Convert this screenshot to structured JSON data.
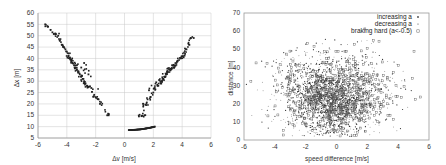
{
  "chart_data": [
    {
      "type": "scatter",
      "title": "",
      "xlabel": "Δv [m/s]",
      "ylabel": "Δx [m]",
      "xlim": [
        -6,
        6
      ],
      "ylim": [
        5,
        60
      ],
      "xticks": [
        -6,
        -4,
        -2,
        0,
        2,
        4,
        6
      ],
      "yticks": [
        5,
        10,
        15,
        20,
        25,
        30,
        35,
        40,
        45,
        50,
        55,
        60
      ],
      "grid": true,
      "legend": null,
      "series": [
        {
          "name": "left branch (closing in)",
          "description": "approximately linear band from (-5.5, 55) down to (-1.1, 15)",
          "points": [
            [
              -5.5,
              55
            ],
            [
              -5.3,
              54
            ],
            [
              -5.0,
              51.5
            ],
            [
              -4.8,
              51
            ],
            [
              -4.6,
              50
            ],
            [
              -4.5,
              48
            ],
            [
              -4.3,
              46
            ],
            [
              -4.2,
              45
            ],
            [
              -4.0,
              43
            ],
            [
              -3.9,
              41
            ],
            [
              -3.8,
              40
            ],
            [
              -3.7,
              39
            ],
            [
              -3.6,
              38
            ],
            [
              -3.5,
              37
            ],
            [
              -3.4,
              36
            ],
            [
              -3.3,
              35
            ],
            [
              -3.2,
              34
            ],
            [
              -3.1,
              33
            ],
            [
              -3.0,
              32
            ],
            [
              -2.9,
              31
            ],
            [
              -2.8,
              30
            ],
            [
              -2.7,
              29
            ],
            [
              -2.6,
              28
            ],
            [
              -2.5,
              27.5
            ],
            [
              -2.3,
              27
            ],
            [
              -2.1,
              24
            ],
            [
              -2.0,
              23
            ],
            [
              -1.8,
              22
            ],
            [
              -1.7,
              20
            ],
            [
              -1.2,
              15
            ],
            [
              -1.1,
              15
            ],
            [
              -2.8,
              38
            ],
            [
              -2.5,
              33
            ],
            [
              -3.0,
              36
            ],
            [
              -4.1,
              44
            ],
            [
              -3.3,
              37
            ]
          ]
        },
        {
          "name": "right branch (falling back)",
          "description": "approximately linear band from (1.3, 20) up to (4.8, 49)",
          "points": [
            [
              1.0,
              14.5
            ],
            [
              1.2,
              14.8
            ],
            [
              1.4,
              15
            ],
            [
              1.3,
              20
            ],
            [
              1.5,
              19.5
            ],
            [
              1.6,
              22
            ],
            [
              1.8,
              23
            ],
            [
              2.0,
              25
            ],
            [
              2.1,
              27
            ],
            [
              2.3,
              28
            ],
            [
              2.5,
              29
            ],
            [
              2.6,
              30
            ],
            [
              2.7,
              31
            ],
            [
              2.8,
              32
            ],
            [
              2.9,
              33
            ],
            [
              3.0,
              34
            ],
            [
              3.1,
              35
            ],
            [
              3.2,
              35.5
            ],
            [
              3.4,
              36
            ],
            [
              3.5,
              37
            ],
            [
              3.6,
              38
            ],
            [
              3.7,
              39
            ],
            [
              3.9,
              40
            ],
            [
              4.0,
              41
            ],
            [
              4.2,
              42
            ],
            [
              4.3,
              44
            ],
            [
              4.5,
              46
            ],
            [
              4.6,
              49
            ],
            [
              4.8,
              49
            ],
            [
              2.4,
              30.5
            ],
            [
              3.3,
              37
            ],
            [
              2.2,
              29.5
            ],
            [
              1.7,
              26
            ],
            [
              4.1,
              40.5
            ]
          ]
        },
        {
          "name": "low curve",
          "description": "dense thin curve from (0.3, 8.5) to (2.1, 10)",
          "points": [
            [
              0.3,
              8.5
            ],
            [
              0.5,
              8.5
            ],
            [
              0.7,
              8.6
            ],
            [
              0.9,
              8.7
            ],
            [
              1.1,
              8.8
            ],
            [
              1.3,
              9.0
            ],
            [
              1.5,
              9.2
            ],
            [
              1.7,
              9.4
            ],
            [
              1.9,
              9.7
            ],
            [
              2.1,
              10.0
            ]
          ]
        }
      ]
    },
    {
      "type": "scatter",
      "title": "",
      "xlabel": "speed difference [m/s]",
      "ylabel": "distance [m]",
      "xlim": [
        -6,
        6
      ],
      "ylim": [
        0,
        70
      ],
      "xticks": [
        -6,
        -4,
        -2,
        0,
        2,
        4,
        6
      ],
      "yticks": [
        0,
        10,
        20,
        30,
        40,
        50,
        60,
        70
      ],
      "grid": false,
      "legend": {
        "position": "upper right",
        "entries": [
          "increasing a",
          "decreasing a",
          "braking hard (a<-0.5)"
        ]
      },
      "series": [
        {
          "name": "increasing a",
          "marker": "dot",
          "description": "dense cloud centred near (0, 22), spread roughly x∈[-6,6], y∈[3,70]"
        },
        {
          "name": "decreasing a",
          "marker": "dot",
          "description": "dense cloud centred near (0, 22)"
        },
        {
          "name": "braking hard (a<-0.5)",
          "marker": "open square",
          "description": "sparser points overlapping the main cloud"
        }
      ],
      "cloud_summary": {
        "center": [
          -0.2,
          22
        ],
        "std_x": 1.6,
        "std_y": 11,
        "approx_points": 2500
      }
    }
  ],
  "left_chart": {
    "xlabel": "Δv [m/s]",
    "ylabel": "Δx [m]",
    "xticks": [
      "-6",
      "-4",
      "-2",
      "0",
      "2",
      "4",
      "6"
    ],
    "yticks": [
      "5",
      "10",
      "15",
      "20",
      "25",
      "30",
      "35",
      "40",
      "45",
      "50",
      "55",
      "60"
    ]
  },
  "right_chart": {
    "xlabel": "speed difference [m/s]",
    "ylabel": "distance [m]",
    "xticks": [
      "-6",
      "-4",
      "-2",
      "0",
      "2",
      "4",
      "6"
    ],
    "yticks": [
      "0",
      "10",
      "20",
      "30",
      "40",
      "50",
      "60",
      "70"
    ],
    "legend": [
      "increasing a",
      "decreasing a",
      "braking hard (a<-0.5)"
    ]
  },
  "colors": {
    "marker": "#222222",
    "grid": "#c8c8c8",
    "frame": "#9a9a9a",
    "text": "#333333"
  }
}
